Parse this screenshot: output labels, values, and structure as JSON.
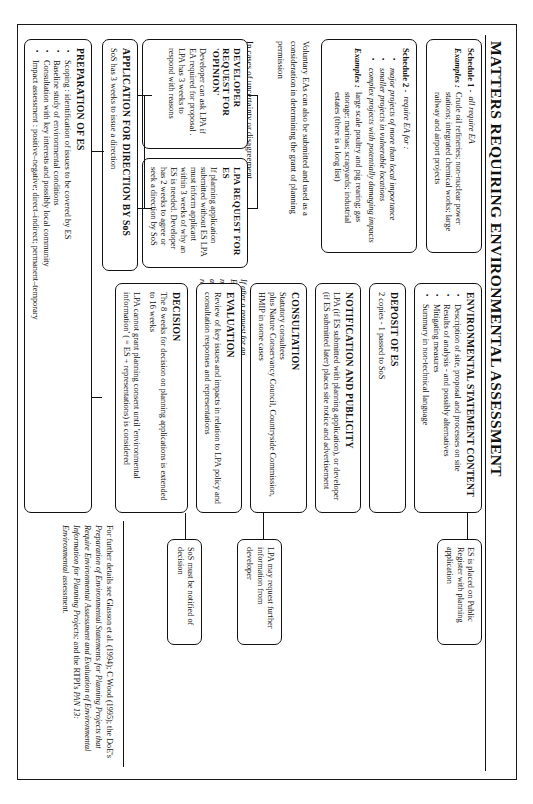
{
  "document": {
    "title": "MATTERS REQUIRING ENVIRONMENTAL ASSESSMENT"
  },
  "schedules": {
    "schedule1": {
      "label": "Schedule 1 -",
      "rule": "all require EA",
      "examples_label": "Examples :",
      "examples": "Crude oil refineries; non-nuclear power stations; integrated chemical works; large railway and airport projects"
    },
    "schedule2": {
      "label": "Schedule 2 -",
      "rule": "require EA for :",
      "bullets": [
        "major projects of more than local importance",
        "smaller projects in vulnerable locations",
        "complex projects with potentially damaging impacts"
      ],
      "examples_label": "Examples :",
      "examples": "large scale poultry and pig rearing; gas storage; marinas; scrapyards; industrial estates (there is a long list)",
      "examples_italic_tail": "(there is a long list)"
    },
    "voluntary": "Voluntary EAs can also be submitted and used as a consideration in determining the grant of planning permission"
  },
  "uncertainty": {
    "caption": "In cases of uncertainty or disagreement"
  },
  "requests": {
    "developer": {
      "header": "DEVELOPER REQUEST FOR 'OPINION'",
      "body": "Developer can ask LPA if EA required for proposal . LPA has 3 weeks to respond with reasons"
    },
    "lpa": {
      "header": "LPA REQUEST FOR ES",
      "body": "If planning application submitted without ES LPA must inform applicant within 3 weeks of why an ES is needed.  Developer has 2 weeks to agree or seek a direction by SoS"
    },
    "side_note": "If after a request for an ES the developer does not respond, the application is deemed refused"
  },
  "application_direction": {
    "header": "APPLICATION FOR DIRECTION BY SoS",
    "body": "SoS has 3 weeks to issue a direction"
  },
  "preparation": {
    "header": "PREPARATION OF ES",
    "bullets": [
      "Scoping : identification of issues to be covered by ES",
      "Baseline study of environmental conditions",
      "Consultation with key interests and possibly local community",
      "Impact assessment : positive–negative; direct–indirect; permanent–temporary"
    ]
  },
  "flow": [
    {
      "id": "es-content",
      "header": "ENVIRONMENTAL STATEMENT CONTENT",
      "bullets": [
        "Description of site, proposal and processes on site",
        "Results of analysis - and possibly alternatives",
        "Mitigating measures",
        "Summary in non-technical language"
      ]
    },
    {
      "id": "deposit",
      "header": "DEPOSIT OF ES",
      "body": "2 copies - 1 passed  to SoS"
    },
    {
      "id": "notification",
      "header": "NOTIFICATION AND PUBLICITY",
      "body": "LPA (if ES submitted with planning application), or developer (if ES submitted later) places site notice and advertisement"
    },
    {
      "id": "consultation",
      "header": "CONSULTATION",
      "body": "Statutory consultees\nplus Nature Conservancy Council, Countryside Commission, HMIP in some cases"
    },
    {
      "id": "evaluation",
      "header": "EVALUATION",
      "body": "Review of key issues and impacts in relation to LPA policy and consultation responses and representations"
    },
    {
      "id": "decision",
      "header": "DECISION",
      "body": "The 8 weeks for decision on planning applications is extended to 16 weeks",
      "body2": "LPA cannot grant planning consent until 'environmental information' ( = ES  +  representations) is considered"
    }
  ],
  "notes": [
    {
      "id": "public-register",
      "text": "ES is placed on Public Register with planning application"
    },
    {
      "id": "further-info",
      "text": "LPA may request further information from developer"
    },
    {
      "id": "sos-notified",
      "text": "SoS must be notified of decision"
    }
  ],
  "footnote": {
    "lead": "For further details see Glasson et al.  (1994); C Wood (1995); the DoE's ",
    "italic1": "Preparation of Environmental Statements for Planning Projects that Require Environmental Assessment and Evaluation of Environmental Information for Planning Projects;",
    "mid": " and the RTPI's ",
    "italic2": "PAN 13: Environmental",
    "tail": " assessment."
  }
}
